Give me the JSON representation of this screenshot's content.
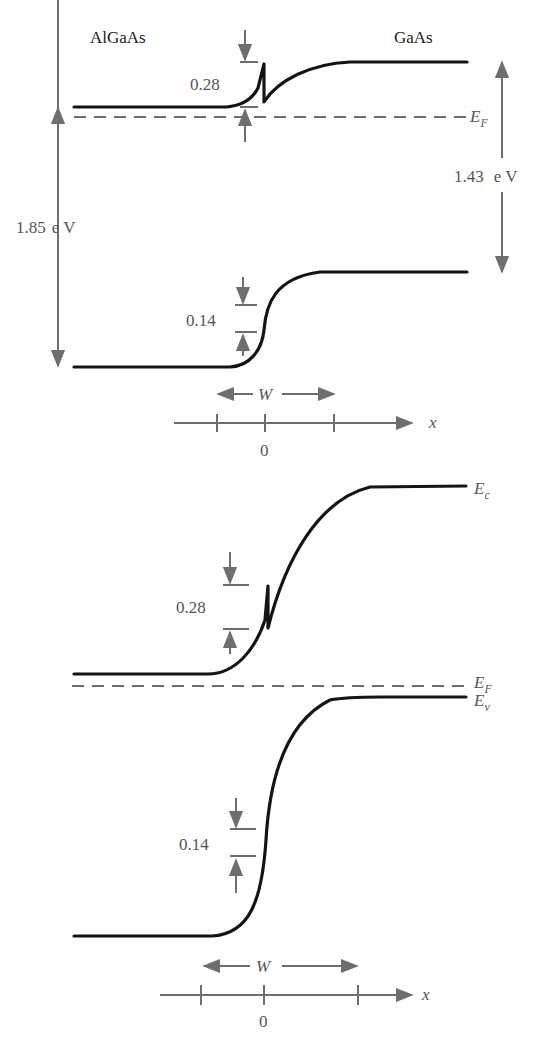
{
  "diagram_a": {
    "left_material": "AlGaAs",
    "right_material": "GaAs",
    "conduction_offset": "0.28",
    "valence_offset": "0.14",
    "left_gap": "1.85",
    "left_gap_unit": "e V",
    "right_gap": "1.43",
    "right_gap_unit": "e V",
    "fermi_label": "E",
    "fermi_sub": "F",
    "depletion_label": "W",
    "axis_label": "x",
    "origin_label": "0"
  },
  "diagram_b": {
    "conduction_offset": "0.28",
    "valence_offset": "0.14",
    "ec_label": "E",
    "ec_sub": "c",
    "fermi_label": "E",
    "fermi_sub": "F",
    "ev_label": "E",
    "ev_sub": "v",
    "depletion_label": "W",
    "axis_label": "x",
    "origin_label": "0"
  },
  "colors": {
    "band_line": "#141414",
    "annotation": "#6e6e6e",
    "background": "#ffffff"
  }
}
